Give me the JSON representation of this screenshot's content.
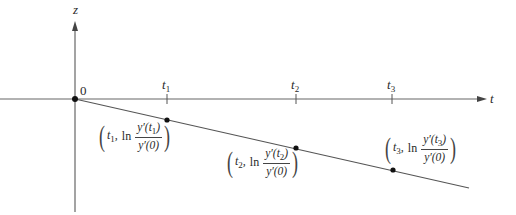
{
  "diagram": {
    "axes": {
      "vertical_label": "z",
      "horizontal_label": "t",
      "origin_label": "0"
    },
    "ticks": [
      {
        "label": "t",
        "sub": "1",
        "x": 167
      },
      {
        "label": "t",
        "sub": "2",
        "x": 296
      },
      {
        "label": "t",
        "sub": "3",
        "x": 392
      }
    ],
    "points": [
      {
        "t": "t",
        "t_sub": "1",
        "fn": "ln",
        "num": "y′(t",
        "num_sub": "1",
        "num_close": ")",
        "den": "y′(0)"
      },
      {
        "t": "t",
        "t_sub": "2",
        "fn": "ln",
        "num": "y′(t",
        "num_sub": "2",
        "num_close": ")",
        "den": "y′(0)"
      },
      {
        "t": "t",
        "t_sub": "3",
        "fn": "ln",
        "num": "y′(t",
        "num_sub": "3",
        "num_close": ")",
        "den": "y′(0)"
      }
    ],
    "colors": {
      "axis": "#555555",
      "line": "#444444",
      "point": "#111111"
    }
  }
}
